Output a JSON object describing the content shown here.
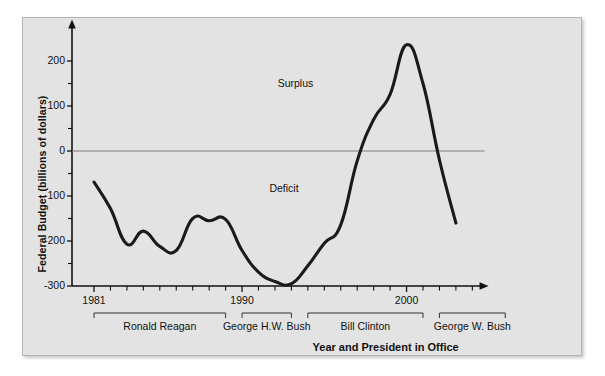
{
  "figure": {
    "background_color": "#e3e3e3",
    "border_color": "#b4b4b4"
  },
  "chart_data": {
    "type": "line",
    "title": "",
    "xlabel": "Year and President in Office",
    "ylabel": "Federal Budget (billions of dollars)",
    "xlim": [
      1980,
      2004
    ],
    "ylim": [
      -300,
      250
    ],
    "grid": false,
    "legend_position": "none",
    "zero_line": true,
    "x_major_ticks": [
      1981,
      1990,
      2000
    ],
    "x_tick_labels": [
      "1981",
      "1990",
      "2000"
    ],
    "x_minor_tick_interval": 1,
    "y_major_ticks": [
      200,
      100,
      0,
      -100,
      -200,
      -300
    ],
    "y_tick_labels": [
      "200",
      "100",
      "0",
      "-100",
      "-200",
      "-300"
    ],
    "y_minor_ticks": [
      150,
      50,
      -50,
      -150,
      -250
    ],
    "series": [
      {
        "name": "Federal Budget Surplus/Deficit",
        "color": "#1a1a1a",
        "x": [
          1981,
          1982,
          1983,
          1984,
          1985,
          1986,
          1987,
          1988,
          1989,
          1990,
          1991,
          1992,
          1993,
          1994,
          1995,
          1996,
          1997,
          1998,
          1999,
          2000,
          2001,
          2002,
          2003
        ],
        "values": [
          -69,
          -128,
          -207,
          -178,
          -212,
          -221,
          -150,
          -155,
          -152,
          -221,
          -269,
          -290,
          -295,
          -255,
          -205,
          -164,
          -22,
          70,
          126,
          236,
          150,
          -20,
          -160
        ]
      }
    ],
    "annotations": [
      {
        "text": "Surplus",
        "x": 1993.5,
        "y": 150
      },
      {
        "text": "Deficit",
        "x": 1993.0,
        "y": -85
      }
    ],
    "president_brackets": [
      {
        "label": "Ronald Reagan",
        "start": 1981,
        "end": 1989
      },
      {
        "label": "George H.W. Bush",
        "start": 1990,
        "end": 1993
      },
      {
        "label": "Bill Clinton",
        "start": 1994,
        "end": 2001
      },
      {
        "label": "George W. Bush",
        "start": 2002,
        "end": 2006
      }
    ]
  }
}
